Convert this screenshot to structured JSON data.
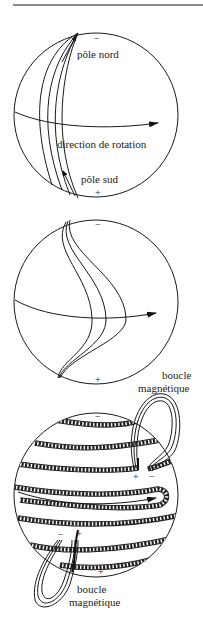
{
  "figure": {
    "panels": [
      {
        "id": "panel-1",
        "labels": {
          "north_sign": "−",
          "north_pole": "pôle nord",
          "rotation": "direction de rotation",
          "south_pole": "pôle sud",
          "south_sign": "+"
        }
      },
      {
        "id": "panel-2",
        "labels": {
          "north_sign": "−",
          "south_sign": "+"
        }
      },
      {
        "id": "panel-3",
        "labels": {
          "loop_top_line1": "boucle",
          "loop_top_line2": "magnétique",
          "north_sign": "−",
          "top_loop_plus": "+",
          "top_loop_minus": "−",
          "bottom_loop_minus": "−",
          "bottom_loop_plus": "+",
          "south_sign": "+",
          "loop_bottom_line1": "boucle",
          "loop_bottom_line2": "magnétique"
        }
      }
    ],
    "colors": {
      "ink": "#1a1a1a",
      "rule": "#8a8a8a",
      "background": "#ffffff"
    }
  }
}
